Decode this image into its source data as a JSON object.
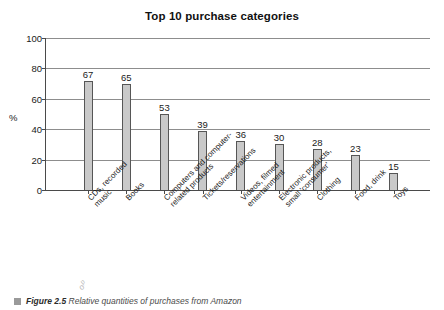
{
  "chart_data": {
    "type": "bar",
    "title": "Top 10 purchase categories",
    "xlabel": "",
    "ylabel": "%",
    "ylim": [
      0,
      100
    ],
    "yticks": [
      0,
      20,
      40,
      60,
      80,
      100
    ],
    "grid": true,
    "legend": false,
    "categories": [
      "CDs, recorded music",
      "Books",
      "Computers and computer-related products",
      "Tickets/reservations",
      "Videos, filmed entertainment",
      "Electronic products, small 'consumer'",
      "Clothing",
      "Food, drink",
      "Toys"
    ],
    "category_lines": [
      "CDs, recorded\nmusic",
      "Books",
      "Computers and computer-\nrelated products",
      "Tickets/reservations",
      "Videos, filmed\nentertainment",
      "Electronic products,\nsmall 'consumer'",
      "Clothing",
      "Food, drink",
      "Toys"
    ],
    "values": [
      67,
      65,
      53,
      39,
      36,
      30,
      28,
      23,
      15
    ],
    "bar_heights_plotted": [
      72,
      70,
      50,
      39,
      32,
      30,
      27,
      23,
      11
    ],
    "data_labels": [
      "67",
      "65",
      "53",
      "39",
      "36",
      "30",
      "28",
      "23",
      "15"
    ],
    "bar_color": "#c9c9c9",
    "bar_edge_color": "#565656",
    "axis_color": "#4a4a4a",
    "gridline_color": "#8d8d8d"
  },
  "caption": {
    "bullet": "figure-bullet",
    "label": "Figure 2.5",
    "text": "Relative quantities of purchases from Amazon"
  }
}
